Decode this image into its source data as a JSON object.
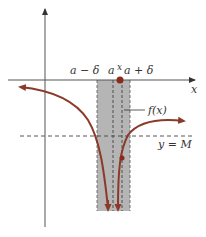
{
  "diagram": {
    "labels": {
      "a_minus_delta": "a − δ",
      "a": "a",
      "x_tick": "x",
      "a_plus_delta": "a + δ",
      "x_axis": "x",
      "f_of_x": "f(x)",
      "y_equals_M": "y = M"
    },
    "colors": {
      "curve": "#8b3a2a",
      "shade": "#a8a8a8",
      "axis": "#555555",
      "dashed": "#444444",
      "point": "#8b2a1a"
    }
  }
}
